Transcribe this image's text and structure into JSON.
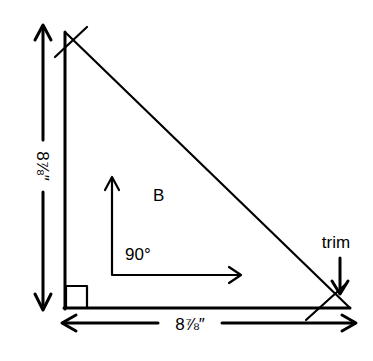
{
  "diagram": {
    "type": "right-triangle-cutting-layout",
    "piece_label": "B",
    "angle_label": "90°",
    "vertical_dimension": "8⅞″",
    "horizontal_dimension": "8⅞″",
    "trim_label": "trim",
    "colors": {
      "line": "#000000",
      "background": "#ffffff"
    }
  }
}
